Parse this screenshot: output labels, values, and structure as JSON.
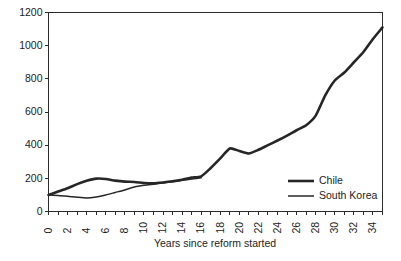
{
  "chart_data": {
    "type": "line",
    "title": "",
    "xlabel": "Years since reform started",
    "ylabel": "",
    "xlim": [
      0,
      35
    ],
    "ylim": [
      0,
      1200
    ],
    "grid": false,
    "legend_position": "right-inside",
    "y_ticks": [
      0,
      200,
      400,
      600,
      800,
      1000,
      1200
    ],
    "y_tick_labels": [
      "0",
      "200",
      "400",
      "600",
      "800",
      "1000",
      "1200"
    ],
    "x_ticks": [
      0,
      1,
      2,
      3,
      4,
      5,
      6,
      7,
      8,
      9,
      10,
      11,
      12,
      13,
      14,
      15,
      16,
      17,
      18,
      19,
      20,
      21,
      22,
      23,
      24,
      25,
      26,
      27,
      28,
      29,
      30,
      31,
      32,
      33,
      34,
      35
    ],
    "x_tick_labels": [
      "0",
      "2",
      "4",
      "6",
      "8",
      "10",
      "12",
      "14",
      "16",
      "18",
      "20",
      "22",
      "24",
      "26",
      "28",
      "30",
      "32",
      "34"
    ],
    "x_tick_label_values": [
      0,
      2,
      4,
      6,
      8,
      10,
      12,
      14,
      16,
      18,
      20,
      22,
      24,
      26,
      28,
      30,
      32,
      34
    ],
    "x_tick_label_rotation": -90,
    "series": [
      {
        "name": "Chile",
        "color": "#262626",
        "line_width": 2.6,
        "x": [
          0,
          1,
          2,
          3,
          4,
          5,
          6,
          7,
          8,
          9,
          10,
          11,
          12,
          13,
          14,
          15,
          16,
          17,
          18,
          19,
          20,
          21,
          22,
          23,
          24,
          25,
          26,
          27,
          28,
          29,
          30,
          31,
          32,
          33,
          34,
          35
        ],
        "values": [
          100,
          120,
          140,
          165,
          185,
          198,
          196,
          186,
          180,
          178,
          172,
          170,
          175,
          182,
          192,
          205,
          212,
          262,
          320,
          380,
          365,
          350,
          372,
          400,
          428,
          458,
          490,
          520,
          578,
          700,
          790,
          838,
          900,
          962,
          1040,
          1110
        ]
      },
      {
        "name": "South Korea",
        "color": "#262626",
        "line_width": 1.5,
        "x": [
          0,
          1,
          2,
          3,
          4,
          5,
          6,
          7,
          8,
          9,
          10,
          11,
          12,
          13,
          14,
          15,
          16
        ],
        "values": [
          100,
          97,
          92,
          86,
          82,
          88,
          100,
          115,
          130,
          148,
          158,
          165,
          172,
          180,
          188,
          196,
          203
        ]
      }
    ],
    "legend": [
      {
        "label": "Chile",
        "color": "#262626",
        "line_width": 2.6
      },
      {
        "label": "South Korea",
        "color": "#262626",
        "line_width": 1.5
      }
    ]
  },
  "colors": {
    "background": "#ffffff",
    "axis": "#2b2b2b",
    "text": "#1c1c1c",
    "series": "#262626"
  }
}
